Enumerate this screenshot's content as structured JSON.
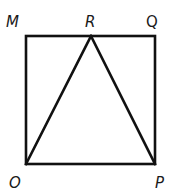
{
  "diagram": {
    "shape": "square with inscribed triangle",
    "line_color": "#111111",
    "vertices": {
      "M": {
        "label": "M",
        "x": 26,
        "y": 36
      },
      "R": {
        "label": "R",
        "x": 91,
        "y": 36
      },
      "Q": {
        "label": "Q",
        "x": 155,
        "y": 36
      },
      "O": {
        "label": "O",
        "x": 26,
        "y": 164
      },
      "P": {
        "label": "P",
        "x": 155,
        "y": 164
      }
    },
    "segments": [
      {
        "from": "M",
        "to": "Q"
      },
      {
        "from": "Q",
        "to": "P"
      },
      {
        "from": "P",
        "to": "O"
      },
      {
        "from": "O",
        "to": "M"
      },
      {
        "from": "O",
        "to": "R"
      },
      {
        "from": "R",
        "to": "P"
      }
    ],
    "labels": [
      {
        "text": "M",
        "x": 6,
        "y": 27
      },
      {
        "text": "R",
        "x": 85,
        "y": 27
      },
      {
        "text": "Q",
        "x": 146,
        "y": 27
      },
      {
        "text": "O",
        "x": 9,
        "y": 188
      },
      {
        "text": "P",
        "x": 155,
        "y": 188
      }
    ]
  }
}
